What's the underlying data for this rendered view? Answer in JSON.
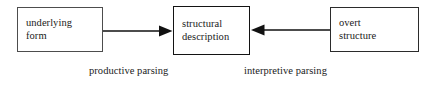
{
  "figure": {
    "type": "flow-diagram",
    "background_color": "#ffffff",
    "text_color": "#1a1a1a",
    "nodes": [
      {
        "id": "underlying-form",
        "line1": "underlying",
        "line2": "form",
        "border_color": "#4d4d4d"
      },
      {
        "id": "structural-description",
        "line1": "structural",
        "line2": "description",
        "border_color": "#131313"
      },
      {
        "id": "overt-structure",
        "line1": "overt",
        "line2": "structure",
        "border_color": "#2b2b2b"
      }
    ],
    "edges": [
      {
        "id": "productive-parsing",
        "from": "underlying-form",
        "to": "structural-description",
        "direction": "right",
        "label": "productive parsing",
        "color": "#111111"
      },
      {
        "id": "interpretive-parsing",
        "from": "overt-structure",
        "to": "structural-description",
        "direction": "left",
        "label": "interpretive parsing",
        "color": "#111111"
      }
    ]
  }
}
